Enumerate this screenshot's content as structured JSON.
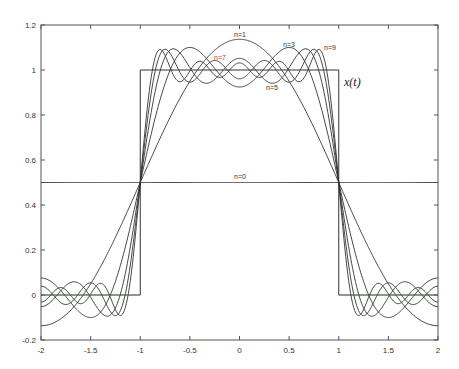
{
  "chart_data": {
    "type": "line",
    "title": "",
    "xlabel": "",
    "ylabel": "",
    "xlim": [
      -2,
      2
    ],
    "ylim": [
      -0.2,
      1.2
    ],
    "grid": false,
    "x_ticks": [
      -2,
      -1.5,
      -1,
      -0.5,
      0,
      0.5,
      1,
      1.5,
      2
    ],
    "x_tick_labels": [
      "-2",
      "-1.5",
      "-1",
      "-0.5",
      "0",
      "0.5",
      "1",
      "1.5",
      "2"
    ],
    "y_ticks": [
      -0.2,
      0,
      0.2,
      0.4,
      0.6,
      0.8,
      1,
      1.2
    ],
    "y_tick_labels": [
      "-0.2",
      "0",
      "0.2",
      "0.4",
      "0.6",
      "0.8",
      "1",
      "1.2"
    ],
    "target_signal": {
      "name": "x(t)",
      "points": [
        [
          -2,
          0
        ],
        [
          -1,
          0
        ],
        [
          -1,
          1
        ],
        [
          1,
          1
        ],
        [
          1,
          0
        ],
        [
          2,
          0
        ]
      ]
    },
    "series": [
      {
        "name": "n=0",
        "harmonics": 0,
        "value_at_0": 0.5,
        "value_at_1": 0.5
      },
      {
        "name": "n=1",
        "harmonics": 1,
        "value_at_0": 1.137,
        "value_at_2": -0.137
      },
      {
        "name": "n=3",
        "harmonics": 3,
        "value_at_0": 0.925
      },
      {
        "name": "n=5",
        "harmonics": 5,
        "value_at_0": 1.052
      },
      {
        "name": "n=7",
        "harmonics": 7,
        "value_at_0": 0.961
      },
      {
        "name": "n=9",
        "harmonics": 9,
        "value_at_0": 1.032
      }
    ]
  },
  "labels": {
    "n0": "n=0",
    "n1": "n=1",
    "n3": "n=3",
    "n5": "n=5",
    "n7": "n=7",
    "n9": "n=9",
    "xt": "x(t)"
  },
  "colors": {
    "axis": "#555555",
    "curve": "#333333",
    "n7_label": "#cc3333",
    "zero_line_accent": "#55aa44"
  }
}
